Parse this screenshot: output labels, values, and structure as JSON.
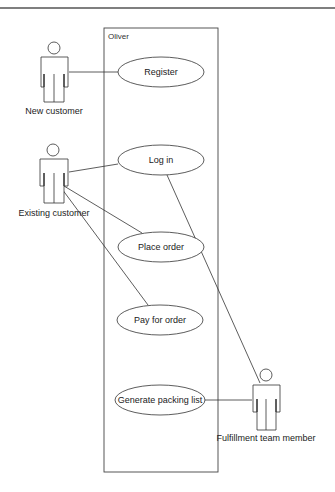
{
  "diagram": {
    "type": "uml-use-case",
    "system": {
      "name": "Oliver"
    },
    "actors": [
      {
        "id": "new-customer",
        "label": "New customer"
      },
      {
        "id": "existing-customer",
        "label": "Existing customer"
      },
      {
        "id": "fulfillment-team-member",
        "label": "Fulfillment team member"
      }
    ],
    "use_cases": [
      {
        "id": "register",
        "label": "Register"
      },
      {
        "id": "log-in",
        "label": "Log in"
      },
      {
        "id": "place-order",
        "label": "Place order"
      },
      {
        "id": "pay-for-order",
        "label": "Pay for order"
      },
      {
        "id": "generate-packing-list",
        "label": "Generate packing list"
      }
    ],
    "associations": [
      {
        "actor": "new-customer",
        "use_case": "register"
      },
      {
        "actor": "existing-customer",
        "use_case": "log-in"
      },
      {
        "actor": "existing-customer",
        "use_case": "place-order"
      },
      {
        "actor": "existing-customer",
        "use_case": "pay-for-order"
      },
      {
        "actor": "fulfillment-team-member",
        "use_case": "log-in"
      },
      {
        "actor": "fulfillment-team-member",
        "use_case": "generate-packing-list"
      }
    ]
  },
  "colors": {
    "line": "#333333",
    "background": "#ffffff",
    "top_rule": "#555555"
  }
}
